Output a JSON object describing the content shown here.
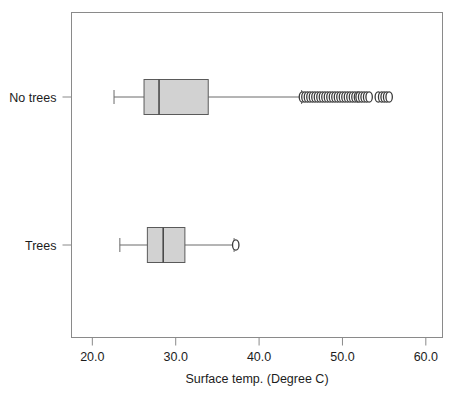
{
  "chart_data": {
    "type": "box",
    "orientation": "horizontal",
    "title": "",
    "xlabel": "Surface temp. (Degree C)",
    "ylabel": "",
    "xlim": [
      17.5,
      62.0
    ],
    "xticks": [
      20.0,
      30.0,
      40.0,
      50.0,
      60.0
    ],
    "xticklabels": [
      "20.0",
      "30.0",
      "40.0",
      "50.0",
      "60.0"
    ],
    "categories": [
      "No trees",
      "Trees"
    ],
    "grid": false,
    "legend": null,
    "boxes": [
      {
        "category": "No trees",
        "whisker_low": 22.6,
        "q1": 26.2,
        "median": 28.0,
        "q3": 33.9,
        "whisker_high": 45.1,
        "outliers": [
          45.2,
          45.5,
          45.8,
          46.1,
          46.4,
          46.7,
          47.0,
          47.3,
          47.6,
          47.9,
          48.2,
          48.5,
          48.8,
          49.1,
          49.4,
          49.7,
          50.0,
          50.3,
          50.6,
          50.9,
          51.2,
          51.5,
          51.8,
          52.0,
          52.3,
          52.6,
          52.9,
          53.2,
          54.3,
          54.7,
          55.0,
          55.3,
          55.6
        ],
        "outlier_note": "dense overlapping cluster from about 45 to 53, plus a separated group near 54-56"
      },
      {
        "category": "Trees",
        "whisker_low": 23.3,
        "q1": 26.6,
        "median": 28.5,
        "q3": 31.1,
        "whisker_high": 37.0,
        "outliers": [
          37.2
        ],
        "outlier_note": "single outlier just beyond the upper whisker"
      }
    ],
    "colors": {
      "box_fill": "#d2d2d2",
      "box_edge": "#5a5a5a",
      "median": "#4a4a4a",
      "whisker": "#6a6a6a",
      "outlier_edge": "#3a3a3a",
      "outlier_fill": "#ffffff",
      "frame": "#8a8a8a",
      "text": "#1c1c1c",
      "background": "#ffffff"
    }
  }
}
